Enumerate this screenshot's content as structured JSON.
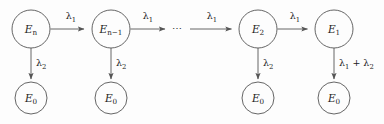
{
  "diagram": {
    "background_color": "#fdfdfd",
    "stroke_color": "#555555",
    "text_color": "#222222",
    "ellipsis": "⋯",
    "nodes": [
      {
        "id": "En",
        "label_base": "E",
        "label_sub": "n",
        "cx": 31,
        "cy": 29,
        "r": 19
      },
      {
        "id": "Enm1",
        "label_base": "E",
        "label_sub": "n−1",
        "cx": 111,
        "cy": 29,
        "r": 19
      },
      {
        "id": "E2",
        "label_base": "E",
        "label_sub": "2",
        "cx": 258,
        "cy": 29,
        "r": 19
      },
      {
        "id": "E1",
        "label_base": "E",
        "label_sub": "1",
        "cx": 334,
        "cy": 29,
        "r": 19
      },
      {
        "id": "E0a",
        "label_base": "E",
        "label_sub": "0",
        "cx": 31,
        "cy": 98,
        "r": 16
      },
      {
        "id": "E0b",
        "label_base": "E",
        "label_sub": "0",
        "cx": 111,
        "cy": 98,
        "r": 16
      },
      {
        "id": "E0c",
        "label_base": "E",
        "label_sub": "0",
        "cx": 258,
        "cy": 98,
        "r": 16
      },
      {
        "id": "E0d",
        "label_base": "E",
        "label_sub": "0",
        "cx": 334,
        "cy": 98,
        "r": 16
      }
    ],
    "edge_labels": {
      "lambda1": "λ",
      "lambda1_sub": "1",
      "lambda2": "λ",
      "lambda2_sub": "2",
      "lambda_sum_prefix": "λ",
      "lambda_sum_sub1": "1",
      "lambda_sum_plus": " + ",
      "lambda_sum_sub2": "2"
    },
    "edges": [
      {
        "id": "En-to-Enm1",
        "type": "horizontal",
        "label": "lambda1",
        "label_x": 71,
        "label_y": 18
      },
      {
        "id": "Enm1-to-dots",
        "type": "horizontal",
        "label": "lambda1",
        "label_x": 148,
        "label_y": 18
      },
      {
        "id": "dots-to-E2",
        "type": "horizontal",
        "label": "lambda1",
        "label_x": 213,
        "label_y": 18
      },
      {
        "id": "E2-to-E1",
        "type": "horizontal",
        "label": "lambda1",
        "label_x": 297,
        "label_y": 18
      },
      {
        "id": "En-to-E0a",
        "type": "vertical",
        "label": "lambda2",
        "label_x": 42,
        "label_y": 66
      },
      {
        "id": "Enm1-to-E0b",
        "type": "vertical",
        "label": "lambda2",
        "label_x": 122,
        "label_y": 66
      },
      {
        "id": "E2-to-E0c",
        "type": "vertical",
        "label": "lambda2",
        "label_x": 269,
        "label_y": 66
      },
      {
        "id": "E1-to-E0d",
        "type": "vertical",
        "label": "lambda_sum",
        "label_x": 344,
        "label_y": 66
      }
    ]
  }
}
